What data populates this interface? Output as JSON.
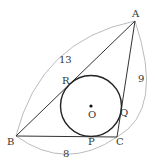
{
  "diagram": {
    "type": "triangle-incircle",
    "points": {
      "A": {
        "label": "A",
        "x": 135,
        "y": 21
      },
      "B": {
        "label": "B",
        "x": 16,
        "y": 136
      },
      "C": {
        "label": "C",
        "x": 117,
        "y": 137
      }
    },
    "circle": {
      "center_label": "O",
      "cx": 91,
      "cy": 106,
      "r": 30.5
    },
    "tangent_points": {
      "P": "P",
      "Q": "Q",
      "R": "R"
    },
    "side_lengths": {
      "AB": "13",
      "AC": "9",
      "BC": "8"
    },
    "colors": {
      "line": "#333333",
      "arc": "#aaaaaa"
    }
  }
}
